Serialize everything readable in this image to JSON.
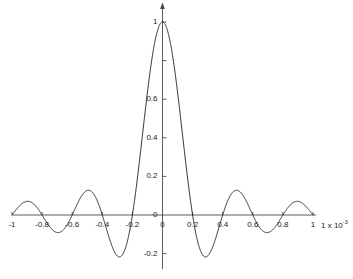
{
  "chart_data": {
    "type": "line",
    "title": "",
    "subtitle": "",
    "xlabel": "",
    "ylabel": "",
    "xlim": [
      -1,
      1
    ],
    "ylim": [
      -0.28,
      1.06
    ],
    "grid": false,
    "legend": null,
    "x_scale_factor": "1 x 10",
    "x_scale_exponent": "-3",
    "x_tick_labels": [
      "-1",
      "-0.8",
      "-0.6",
      "-0.4",
      "-0.2",
      "0",
      "0.2",
      "0.4",
      "0.6",
      "0.8",
      "1"
    ],
    "x_tick_values": [
      -1,
      -0.8,
      -0.6,
      -0.4,
      -0.2,
      0,
      0.2,
      0.4,
      0.6,
      0.8,
      1
    ],
    "y_tick_labels": [
      "1",
      "",
      "0.6",
      "0.4",
      "0.2",
      "0",
      "-0.2"
    ],
    "y_tick_values": [
      1,
      0.8,
      0.6,
      0.4,
      0.2,
      0,
      -0.2
    ],
    "series": [
      {
        "name": "sinc",
        "description": "sin(pi*x/0.2)/(pi*x/0.2)",
        "color": "#1a1a1a",
        "zero_crossings": [
          -0.8,
          -0.6,
          -0.4,
          -0.2,
          0.2,
          0.4,
          0.6,
          0.8
        ],
        "peak_value": 1.0,
        "peak_x": 0,
        "sidelobe_minima": [
          -0.3,
          0.3
        ],
        "sidelobe_minimum_value": -0.14,
        "sidelobe_maxima": [
          -0.5,
          0.5
        ],
        "sidelobe_maximum_value": 0.091,
        "x": [
          -1.0,
          -0.98,
          -0.96,
          -0.94,
          -0.92,
          -0.9,
          -0.88,
          -0.86,
          -0.84,
          -0.82,
          -0.8,
          -0.78,
          -0.76,
          -0.74,
          -0.72,
          -0.7,
          -0.68,
          -0.66,
          -0.64,
          -0.62,
          -0.6,
          -0.58,
          -0.56,
          -0.54,
          -0.52,
          -0.5,
          -0.48,
          -0.46,
          -0.44,
          -0.42,
          -0.4,
          -0.38,
          -0.36,
          -0.34,
          -0.32,
          -0.3,
          -0.28,
          -0.26,
          -0.24,
          -0.22,
          -0.2,
          -0.18,
          -0.16,
          -0.14,
          -0.12,
          -0.1,
          -0.08,
          -0.06,
          -0.04,
          -0.02,
          0.0,
          0.02,
          0.04,
          0.06,
          0.08,
          0.1,
          0.12,
          0.14,
          0.16,
          0.18,
          0.2,
          0.22,
          0.24,
          0.26,
          0.28,
          0.3,
          0.32,
          0.34,
          0.36,
          0.38,
          0.4,
          0.42,
          0.44,
          0.46,
          0.48,
          0.5,
          0.52,
          0.54,
          0.56,
          0.58,
          0.6,
          0.62,
          0.64,
          0.66,
          0.68,
          0.7,
          0.72,
          0.74,
          0.76,
          0.78,
          0.8,
          0.82,
          0.84,
          0.86,
          0.88,
          0.9,
          0.92,
          0.94,
          0.96,
          0.98,
          1.0
        ],
        "y": [
          0.0,
          0.0127,
          0.0247,
          0.0349,
          0.0427,
          0.0473,
          0.0483,
          0.0457,
          0.0395,
          0.0302,
          0.0,
          -0.0206,
          -0.0345,
          -0.0448,
          -0.0509,
          -0.0526,
          -0.0497,
          -0.0425,
          -0.0313,
          -0.0171,
          0.0,
          0.0206,
          0.0408,
          0.0589,
          0.0731,
          0.0818,
          0.0841,
          0.0792,
          0.0671,
          0.0487,
          0.0,
          -0.0459,
          -0.0819,
          -0.1104,
          -0.1294,
          -0.1378,
          -0.1351,
          -0.1216,
          -0.0981,
          -0.0664,
          0.0,
          0.0772,
          0.1564,
          0.2327,
          0.3037,
          0.3679,
          0.4247,
          0.4736,
          0.5151,
          0.5497,
          1.0,
          0.5497,
          0.5151,
          0.4736,
          0.4247,
          0.3679,
          0.3037,
          0.2327,
          0.1564,
          0.0772,
          0.0,
          -0.0664,
          -0.0981,
          -0.1216,
          -0.1351,
          -0.1378,
          -0.1294,
          -0.1104,
          -0.0819,
          -0.0459,
          0.0,
          0.0487,
          0.0671,
          0.0792,
          0.0841,
          0.0818,
          0.0731,
          0.0589,
          0.0408,
          0.0206,
          0.0,
          -0.0171,
          -0.0313,
          -0.0425,
          -0.0497,
          -0.0526,
          -0.0509,
          -0.0448,
          -0.0345,
          -0.0206,
          0.0,
          0.0302,
          0.0395,
          0.0457,
          0.0483,
          0.0473,
          0.0427,
          0.0349,
          0.0247,
          0.0127,
          0.0
        ]
      }
    ]
  },
  "axes": {
    "x_axis_name": "x-axis",
    "y_axis_name": "y-axis",
    "y_axis_has_arrow": true,
    "axis_color": "#4a4a4a",
    "curve_color": "#1a1a1a"
  }
}
